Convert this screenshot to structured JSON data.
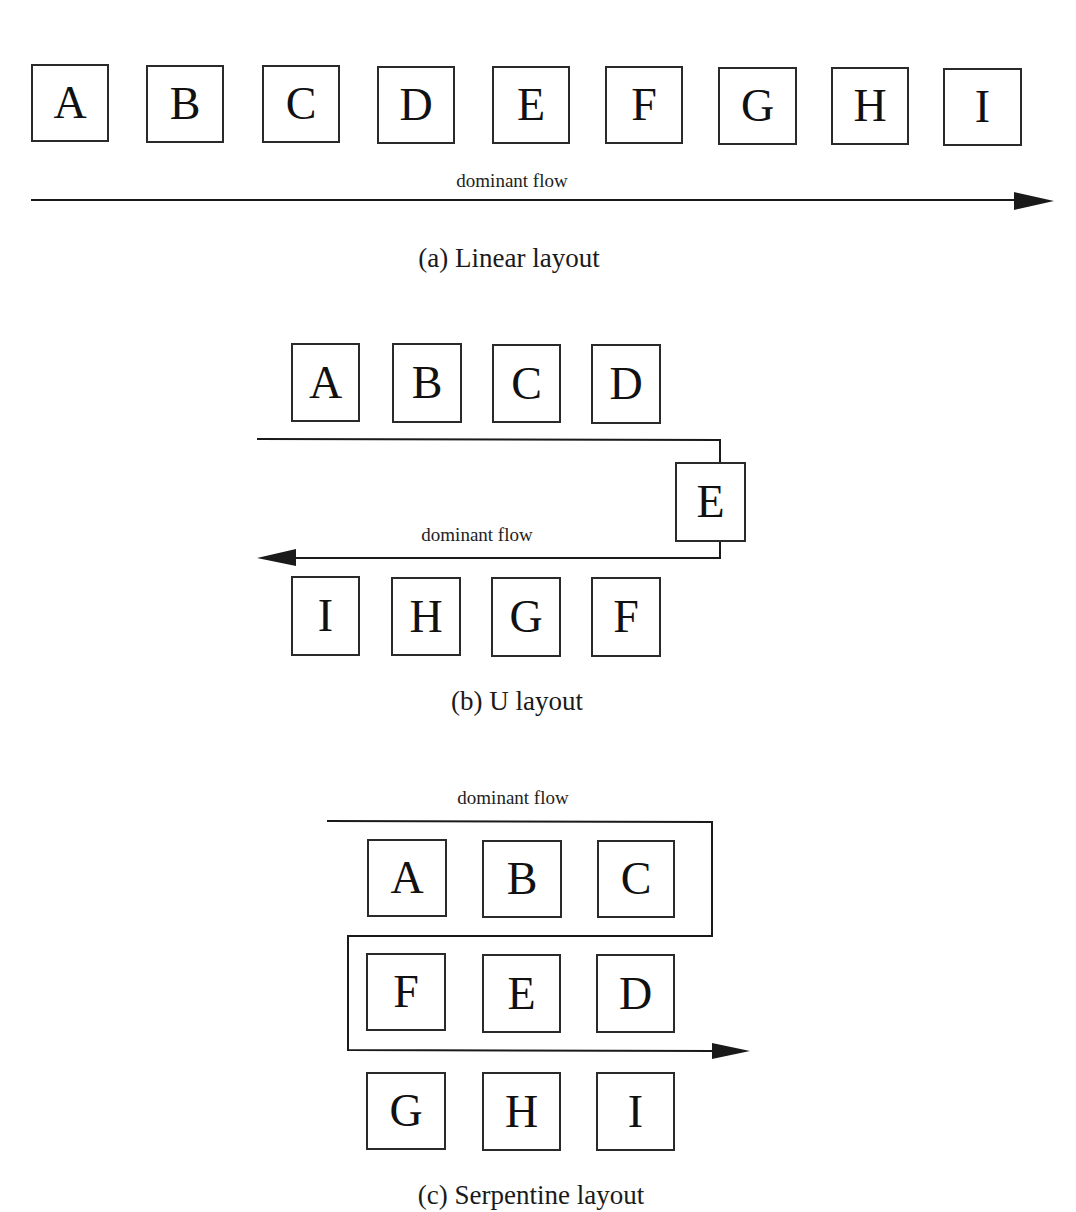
{
  "diagrams": {
    "linear": {
      "boxes": [
        "A",
        "B",
        "C",
        "D",
        "E",
        "F",
        "G",
        "H",
        "I"
      ],
      "flow_label": "dominant flow",
      "caption": "(a) Linear layout"
    },
    "u": {
      "top_row": [
        "A",
        "B",
        "C",
        "D"
      ],
      "turn": [
        "E"
      ],
      "bottom_row": [
        "I",
        "H",
        "G",
        "F"
      ],
      "flow_label": "dominant flow",
      "caption": "(b) U layout"
    },
    "serpentine": {
      "row1": [
        "A",
        "B",
        "C"
      ],
      "row2": [
        "F",
        "E",
        "D"
      ],
      "row3": [
        "G",
        "H",
        "I"
      ],
      "flow_label": "dominant flow",
      "caption": "(c) Serpentine layout"
    }
  },
  "colors": {
    "stroke": "#2a2a2a",
    "background": "#ffffff"
  }
}
